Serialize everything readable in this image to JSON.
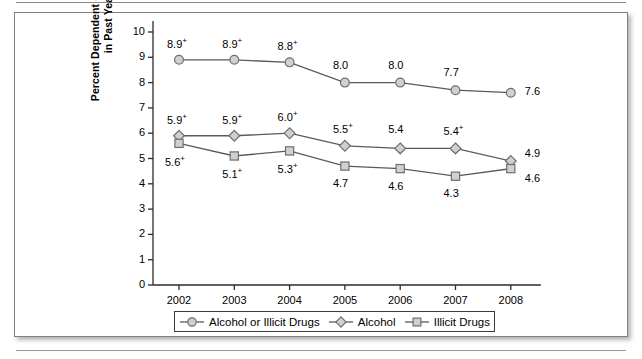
{
  "page": {
    "rule_top": "",
    "rule_bottom": ""
  },
  "chart_data": {
    "type": "line",
    "title": "",
    "xlabel": "",
    "ylabel": "Percent Dependent or Abusing\nin Past Year",
    "categories": [
      "2002",
      "2003",
      "2004",
      "2005",
      "2006",
      "2007",
      "2008"
    ],
    "ylim": [
      0,
      10
    ],
    "yticks": [
      "0",
      "1",
      "2",
      "3",
      "4",
      "5",
      "6",
      "7",
      "8",
      "9",
      "10"
    ],
    "grid": false,
    "legend_position": "bottom",
    "series": [
      {
        "name": "Alcohol or Illicit Drugs",
        "marker": "circle",
        "values": [
          8.9,
          8.9,
          8.8,
          8.0,
          8.0,
          7.7,
          7.6
        ],
        "labels": [
          "8.9+",
          "8.9+",
          "8.8+",
          "8.0",
          "8.0",
          "7.7",
          "7.6"
        ]
      },
      {
        "name": "Alcohol",
        "marker": "diamond",
        "values": [
          5.9,
          5.9,
          6.0,
          5.5,
          5.4,
          5.4,
          4.9
        ],
        "labels": [
          "5.9+",
          "5.9+",
          "6.0+",
          "5.5+",
          "5.4",
          "5.4+",
          "4.9"
        ]
      },
      {
        "name": "Illicit Drugs",
        "marker": "square",
        "values": [
          5.6,
          5.1,
          5.3,
          4.7,
          4.6,
          4.3,
          4.6
        ],
        "labels": [
          "5.6+",
          "5.1+",
          "5.3+",
          "4.7",
          "4.6",
          "4.3",
          "4.6"
        ]
      }
    ],
    "colors": {
      "line": "#5a5a5a",
      "marker_fill": "#d0d0d0",
      "marker_stroke": "#6e6e6e",
      "axis": "#2b2b2b",
      "text": "#000000"
    }
  },
  "legend": {
    "items": [
      {
        "label": "Alcohol or Illicit Drugs",
        "marker": "circle"
      },
      {
        "label": "Alcohol",
        "marker": "diamond"
      },
      {
        "label": "Illicit Drugs",
        "marker": "square"
      }
    ]
  }
}
